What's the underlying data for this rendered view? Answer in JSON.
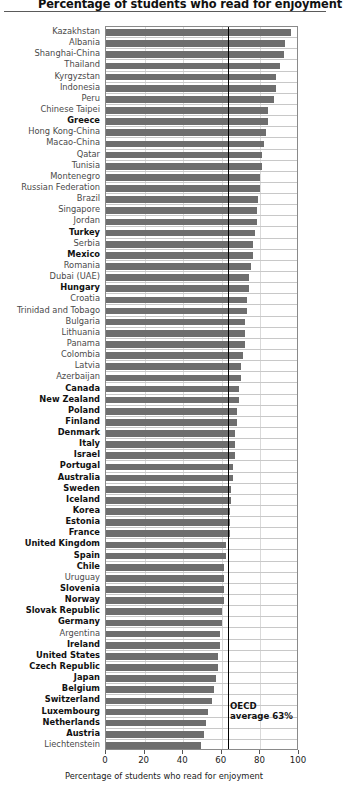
{
  "title": "Percentage of students who read for enjoyment",
  "annotation": {
    "line1": "OECD",
    "line2": "average 63%"
  },
  "chart_data": {
    "type": "bar",
    "orientation": "horizontal",
    "title": "Percentage of students who read for enjoyment",
    "xlabel": "Percentage of students who read for enjoyment",
    "ylabel": "",
    "xlim": [
      0,
      100
    ],
    "xticks": [
      0,
      20,
      40,
      60,
      80,
      100
    ],
    "grid": "vertical",
    "legend": "none",
    "reference_line": {
      "label": "OECD average 63%",
      "value": 63
    },
    "bar_color": "#6e6e6e",
    "categories": [
      "Kazakhstan",
      "Albania",
      "Shanghai-China",
      "Thailand",
      "Kyrgyzstan",
      "Indonesia",
      "Peru",
      "Chinese Taipei",
      "Greece",
      "Hong Kong-China",
      "Macao-China",
      "Qatar",
      "Tunisia",
      "Montenegro",
      "Russian Federation",
      "Brazil",
      "Singapore",
      "Jordan",
      "Turkey",
      "Serbia",
      "Mexico",
      "Romania",
      "Dubai (UAE)",
      "Hungary",
      "Croatia",
      "Trinidad and Tobago",
      "Bulgaria",
      "Lithuania",
      "Panama",
      "Colombia",
      "Latvia",
      "Azerbaijan",
      "Canada",
      "New Zealand",
      "Poland",
      "Finland",
      "Denmark",
      "Italy",
      "Israel",
      "Portugal",
      "Australia",
      "Sweden",
      "Iceland",
      "Korea",
      "Estonia",
      "France",
      "United Kingdom",
      "Spain",
      "Chile",
      "Uruguay",
      "Slovenia",
      "Norway",
      "Slovak Republic",
      "Germany",
      "Argentina",
      "Ireland",
      "United States",
      "Czech Republic",
      "Japan",
      "Belgium",
      "Switzerland",
      "Luxembourg",
      "Netherlands",
      "Austria",
      "Liechtenstein"
    ],
    "values": [
      96,
      93,
      92,
      90,
      88,
      88,
      87,
      84,
      84,
      83,
      82,
      81,
      81,
      80,
      80,
      79,
      78,
      78,
      77,
      76,
      76,
      75,
      74,
      74,
      73,
      73,
      72,
      72,
      72,
      71,
      70,
      70,
      69,
      69,
      68,
      68,
      67,
      67,
      67,
      66,
      66,
      65,
      65,
      64,
      64,
      64,
      62,
      62,
      61,
      61,
      61,
      61,
      60,
      60,
      59,
      59,
      58,
      58,
      57,
      56,
      55,
      53,
      52,
      51,
      49
    ],
    "oecd_member": [
      false,
      false,
      false,
      false,
      false,
      false,
      false,
      false,
      true,
      false,
      false,
      false,
      false,
      false,
      false,
      false,
      false,
      false,
      true,
      false,
      true,
      false,
      false,
      true,
      false,
      false,
      false,
      false,
      false,
      false,
      false,
      false,
      true,
      true,
      true,
      true,
      true,
      true,
      true,
      true,
      true,
      true,
      true,
      true,
      true,
      true,
      true,
      true,
      true,
      false,
      true,
      true,
      true,
      true,
      false,
      true,
      true,
      true,
      true,
      true,
      true,
      true,
      true,
      true,
      false
    ]
  }
}
